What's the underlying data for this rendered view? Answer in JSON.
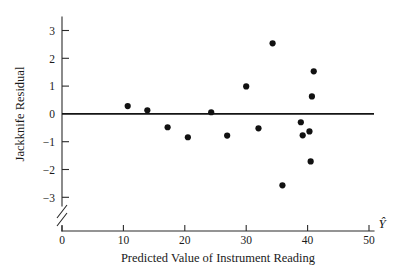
{
  "chart_data": {
    "type": "scatter",
    "title": "",
    "xlabel": "Predicted Value of Instrument Reading",
    "ylabel": "Jackknife Residual",
    "x_symbol": "Ŷ",
    "xlim": [
      0,
      51
    ],
    "ylim": [
      -3.4,
      3.4
    ],
    "grid": false,
    "legend": null,
    "x_ticks": [
      0,
      10,
      20,
      30,
      40,
      50
    ],
    "x_tick_labels": [
      "0",
      "10",
      "20",
      "30",
      "40",
      "50"
    ],
    "y_ticks": [
      -3,
      -2,
      -1,
      0,
      1,
      2,
      3
    ],
    "y_tick_labels": [
      "−3",
      "−2",
      "−1",
      "0",
      "1",
      "2",
      "3"
    ],
    "y_axis_break": true,
    "reference_line": {
      "y": 0,
      "label": "zero-residual-line"
    },
    "points": [
      {
        "x": 10.7,
        "y": 0.28
      },
      {
        "x": 13.9,
        "y": 0.13
      },
      {
        "x": 17.2,
        "y": -0.48
      },
      {
        "x": 20.5,
        "y": -0.84
      },
      {
        "x": 24.3,
        "y": 0.06
      },
      {
        "x": 26.9,
        "y": -0.78
      },
      {
        "x": 30.0,
        "y": 0.99
      },
      {
        "x": 32.0,
        "y": -0.52
      },
      {
        "x": 34.3,
        "y": 2.54
      },
      {
        "x": 35.9,
        "y": -2.57
      },
      {
        "x": 38.9,
        "y": -0.3
      },
      {
        "x": 39.2,
        "y": -0.77
      },
      {
        "x": 40.3,
        "y": -0.63
      },
      {
        "x": 40.7,
        "y": 0.63
      },
      {
        "x": 41.0,
        "y": 1.53
      },
      {
        "x": 40.5,
        "y": -1.71
      }
    ]
  },
  "figure": {
    "name": "jackknife-residual-plot",
    "background_color": "#ffffff",
    "point_color": "#111111",
    "axis_color": "#2b2b2b",
    "line_color": "#141414"
  }
}
